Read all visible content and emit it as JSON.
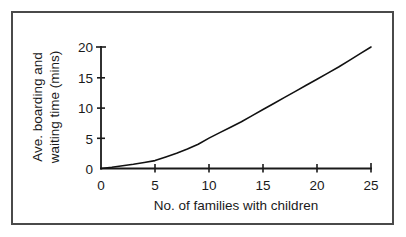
{
  "chart_data": {
    "type": "line",
    "title": "",
    "xlabel": "No. of families with children",
    "ylabel_line1": "Ave. boarding and",
    "ylabel_line2": "waiting time (mins)",
    "ylabel": "Ave. boarding and waiting time (mins)",
    "xlim": [
      0,
      25
    ],
    "ylim": [
      0,
      20
    ],
    "xticks": [
      0,
      5,
      10,
      15,
      20,
      25
    ],
    "yticks": [
      0,
      5,
      10,
      15,
      20
    ],
    "xtick_labels": [
      "0",
      "5",
      "10",
      "15",
      "20",
      "25"
    ],
    "ytick_labels": [
      "0",
      "5",
      "10",
      "15",
      "20"
    ],
    "grid": false,
    "legend": "none",
    "series": [
      {
        "name": "Ave. boarding and waiting time",
        "x": [
          0,
          1,
          2,
          3,
          4,
          5,
          6,
          7,
          8,
          9,
          10,
          11,
          12,
          13,
          14,
          15,
          16,
          17,
          18,
          19,
          20,
          21,
          22,
          23,
          24,
          25
        ],
        "values": [
          0.0,
          0.2,
          0.45,
          0.7,
          1.0,
          1.3,
          1.9,
          2.5,
          3.2,
          4.0,
          5.0,
          5.9,
          6.8,
          7.7,
          8.7,
          9.7,
          10.7,
          11.7,
          12.7,
          13.7,
          14.7,
          15.7,
          16.7,
          17.8,
          18.9,
          20.0
        ]
      }
    ]
  },
  "axes": {
    "x_axis_name": "x-axis",
    "y_axis_name": "y-axis",
    "stroke_color": "#1a1a1a"
  },
  "frame": {
    "border_color": "#4a4a4a",
    "background": "#ffffff"
  }
}
